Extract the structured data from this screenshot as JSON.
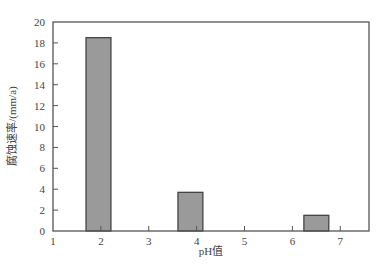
{
  "chart_data": {
    "type": "bar",
    "title": "",
    "xlabel": "pH值",
    "ylabel": "腐蚀速率/(mm/a)",
    "xlim": [
      1,
      7.6
    ],
    "ylim": [
      0,
      20
    ],
    "xticks": [
      1,
      2,
      3,
      4,
      5,
      6,
      7
    ],
    "yticks": [
      0,
      2,
      4,
      6,
      8,
      10,
      12,
      14,
      16,
      18,
      20
    ],
    "grid": false,
    "legend": null,
    "x": [
      1.95,
      3.87,
      6.5
    ],
    "values": [
      18.5,
      3.7,
      1.5
    ],
    "bar_width": 0.52,
    "colors": {
      "bar_fill": "#9a9a9a",
      "bar_edge": "#444444",
      "axis": "#555555"
    }
  }
}
